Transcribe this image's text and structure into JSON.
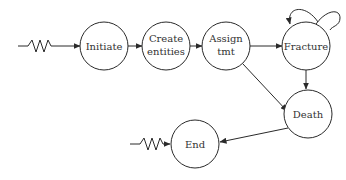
{
  "diagram": {
    "type": "state-flow",
    "nodes": [
      {
        "id": "initiate",
        "lines": [
          "Initiate"
        ]
      },
      {
        "id": "create",
        "lines": [
          "Create",
          "entities"
        ]
      },
      {
        "id": "assign",
        "lines": [
          "Assign",
          "tmt"
        ]
      },
      {
        "id": "fracture",
        "lines": [
          "Fracture"
        ]
      },
      {
        "id": "death",
        "lines": [
          "Death"
        ]
      },
      {
        "id": "end",
        "lines": [
          "End"
        ]
      }
    ],
    "edges": [
      {
        "from": "external",
        "to": "initiate",
        "style": "zigzag"
      },
      {
        "from": "initiate",
        "to": "create"
      },
      {
        "from": "create",
        "to": "assign"
      },
      {
        "from": "assign",
        "to": "fracture"
      },
      {
        "from": "fracture",
        "to": "fracture",
        "style": "self-loop"
      },
      {
        "from": "fracture",
        "to": "death"
      },
      {
        "from": "assign",
        "to": "death"
      },
      {
        "from": "death",
        "to": "end"
      },
      {
        "from": "external",
        "to": "end",
        "style": "zigzag"
      }
    ]
  }
}
